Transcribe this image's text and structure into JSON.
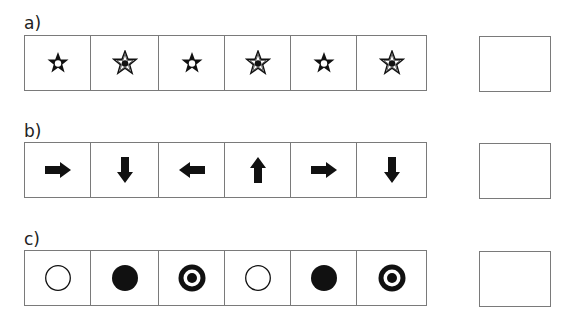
{
  "rows": [
    {
      "label": "a)",
      "items": [
        {
          "icon": "star-solid-with-white-center"
        },
        {
          "icon": "star-outline-with-black-center"
        },
        {
          "icon": "star-solid-with-white-center"
        },
        {
          "icon": "star-outline-with-black-center"
        },
        {
          "icon": "star-solid-with-white-center"
        },
        {
          "icon": "star-outline-with-black-center"
        }
      ],
      "answer": ""
    },
    {
      "label": "b)",
      "items": [
        {
          "icon": "arrow-right"
        },
        {
          "icon": "arrow-down"
        },
        {
          "icon": "arrow-left"
        },
        {
          "icon": "arrow-up"
        },
        {
          "icon": "arrow-right"
        },
        {
          "icon": "arrow-down"
        }
      ],
      "answer": ""
    },
    {
      "label": "c)",
      "items": [
        {
          "icon": "circle-outline"
        },
        {
          "icon": "circle-filled"
        },
        {
          "icon": "circle-target"
        },
        {
          "icon": "circle-outline"
        },
        {
          "icon": "circle-filled"
        },
        {
          "icon": "circle-target"
        }
      ],
      "answer": ""
    }
  ],
  "colors": {
    "stroke": "#7a7a7a",
    "glyph": "#111111",
    "background": "#ffffff"
  }
}
